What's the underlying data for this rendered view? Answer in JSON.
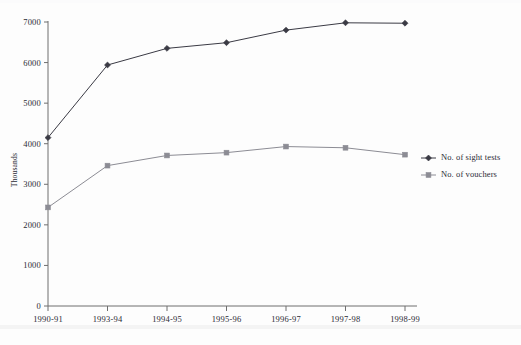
{
  "chart_data": {
    "type": "line",
    "title": "",
    "xlabel": "",
    "ylabel": "Thousands",
    "categories": [
      "1990-91",
      "1993-94",
      "1994-95",
      "1995-96",
      "1996-97",
      "1997-98",
      "1998-99"
    ],
    "series": [
      {
        "name": "No. of sight tests",
        "marker": "diamond",
        "color": "#3a3a44",
        "values": [
          4150,
          5940,
          6350,
          6490,
          6800,
          6980,
          6970
        ]
      },
      {
        "name": "No. of vouchers",
        "marker": "square",
        "color": "#8c8c94",
        "values": [
          2430,
          3460,
          3710,
          3780,
          3930,
          3900,
          3730
        ]
      }
    ],
    "ylim": [
      0,
      7000
    ],
    "yticks": [
      0,
      1000,
      2000,
      3000,
      4000,
      5000,
      6000,
      7000
    ],
    "ytick_labels": [
      "0",
      "1000",
      "2000",
      "3000",
      "4000",
      "5000",
      "6000",
      "7000"
    ],
    "grid": false,
    "legend_position": "right"
  },
  "legend": {
    "entries": [
      {
        "label": "No. of sight tests"
      },
      {
        "label": "No. of vouchers"
      }
    ]
  }
}
